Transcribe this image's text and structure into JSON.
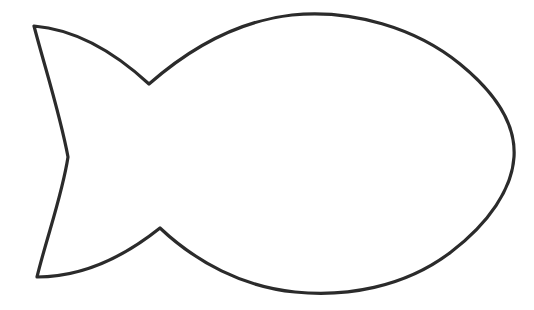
{
  "canvas": {
    "width": 534,
    "height": 310,
    "background_color": "#ffffff",
    "title": "Fish outline line drawing"
  },
  "drawing": {
    "name": "fish-outline",
    "description": "Simple black outline silhouette of a fish with an oval body and a forked tail on the left",
    "stroke_color": "#2b2b2b",
    "fill_color": "#ffffff",
    "stroke_width": 3.2,
    "shapes": [
      {
        "name": "fish-body-and-tail",
        "type": "closed-path",
        "path": "M 34 26 C 70 29 110 48 149 84 C 190 48 238 21 292 15 C 352 9 416 28 460 64 C 498 95 516 126 514 157 C 512 189 489 223 451 252 C 404 288 345 297 295 292 C 243 287 196 262 160 228 C 125 256 83 277 37 277 C 47 236 62 196 68 157 C 60 114 45 68 34 26 Z",
        "vertices": [
          {
            "name": "tail-top-tip",
            "x": 34,
            "y": 26
          },
          {
            "name": "upper-tail-body-notch",
            "x": 149,
            "y": 84
          },
          {
            "name": "body-top",
            "x": 310,
            "y": 14
          },
          {
            "name": "body-nose-right",
            "x": 514,
            "y": 157
          },
          {
            "name": "body-bottom",
            "x": 325,
            "y": 291
          },
          {
            "name": "lower-tail-body-peak",
            "x": 160,
            "y": 228
          },
          {
            "name": "tail-bottom-tip",
            "x": 37,
            "y": 277
          },
          {
            "name": "tail-inner-notch",
            "x": 68,
            "y": 157
          }
        ]
      }
    ]
  }
}
